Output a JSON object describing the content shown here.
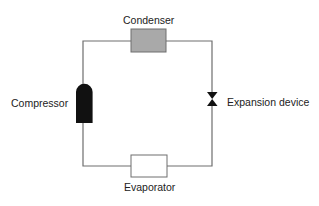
{
  "diagram": {
    "components": {
      "condenser": {
        "label": "Condenser",
        "fill": "#a9a9a9"
      },
      "compressor": {
        "label": "Compressor",
        "fill": "#111111"
      },
      "expansion_device": {
        "label": "Expansion device",
        "fill": "#111111"
      },
      "evaporator": {
        "label": "Evaporator",
        "fill": "#ffffff"
      }
    },
    "line_color": "#777777"
  }
}
